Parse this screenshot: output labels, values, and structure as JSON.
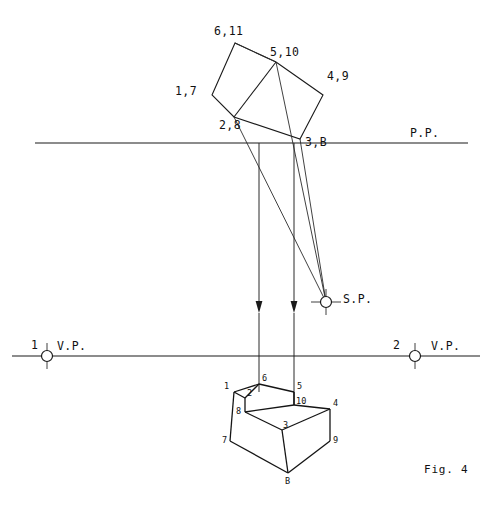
{
  "figure": {
    "caption": "Fig. 4",
    "width": 493,
    "height": 512,
    "background_color": "#ffffff",
    "line_color": "#1a1a1a"
  },
  "reference_lines": {
    "picture_plane": {
      "label": "P.P.",
      "label_x": 410,
      "label_y": 137,
      "y": 143,
      "x1": 35,
      "x2": 468
    },
    "horizon_line": {
      "y": 356,
      "x1": 12,
      "x2": 480
    }
  },
  "station_point": {
    "label": "S.P.",
    "label_x": 343,
    "label_y": 303,
    "x": 326,
    "y": 302,
    "radius": 5.5
  },
  "vanishing_points": [
    {
      "name": "left-vanishing-point",
      "number": "1",
      "label": "V.P.",
      "number_x": 31,
      "number_y": 349,
      "label_x": 57,
      "label_y": 350,
      "x": 47,
      "y": 356,
      "radius": 5.5
    },
    {
      "name": "right-vanishing-point",
      "number": "2",
      "label": "V.P.",
      "number_x": 393,
      "number_y": 349,
      "label_x": 431,
      "label_y": 350,
      "x": 415,
      "y": 356,
      "radius": 5.5
    }
  ],
  "plan_view": {
    "description": "Top plan of the stepped block rotated above the picture plane",
    "vertices": {
      "v1_7": {
        "x": 212,
        "y": 95
      },
      "v6_11": {
        "x": 235,
        "y": 43
      },
      "v5_10": {
        "x": 276,
        "y": 62
      },
      "v4_9": {
        "x": 323,
        "y": 95
      },
      "v3_B": {
        "x": 300,
        "y": 139
      },
      "v2_8": {
        "x": 234,
        "y": 117
      }
    },
    "labels": [
      {
        "name": "plan-label-6-11",
        "text": "6,11",
        "x": 214,
        "y": 35
      },
      {
        "name": "plan-label-5-10",
        "text": "5,10",
        "x": 270,
        "y": 56
      },
      {
        "name": "plan-label-4-9",
        "text": "4,9",
        "x": 327,
        "y": 80
      },
      {
        "name": "plan-label-1-7",
        "text": "1,7",
        "x": 175,
        "y": 95
      },
      {
        "name": "plan-label-2-8",
        "text": "2,8",
        "x": 219,
        "y": 129
      },
      {
        "name": "plan-label-3-B",
        "text": "3,B",
        "x": 305,
        "y": 146
      }
    ]
  },
  "projectors": [
    {
      "name": "projector-left",
      "x": 259,
      "y_top": 143,
      "y_arrow": 313,
      "y_bottom": 392
    },
    {
      "name": "projector-right",
      "x": 294,
      "y_top": 143,
      "y_arrow": 313,
      "y_bottom": 392
    }
  ],
  "sight_lines": [
    {
      "name": "sight-line-from-2-8",
      "x1": 234,
      "y1": 117,
      "x2": 326,
      "y2": 302
    },
    {
      "name": "sight-line-from-5-10",
      "x1": 276,
      "y1": 62,
      "x2": 326,
      "y2": 302
    },
    {
      "name": "sight-line-from-3-B",
      "x1": 300,
      "y1": 139,
      "x2": 326,
      "y2": 302
    }
  ],
  "object_view": {
    "description": "Lower pictorial view of the stepped block",
    "vertices": {
      "p1": {
        "x": 234,
        "y": 392
      },
      "p6": {
        "x": 259,
        "y": 384
      },
      "p5": {
        "x": 294,
        "y": 392
      },
      "p2": {
        "x": 245,
        "y": 398
      },
      "p10": {
        "x": 294,
        "y": 405
      },
      "p8": {
        "x": 245,
        "y": 412
      },
      "p4": {
        "x": 330,
        "y": 409
      },
      "p3": {
        "x": 282,
        "y": 430
      },
      "p7": {
        "x": 230,
        "y": 441
      },
      "p9": {
        "x": 330,
        "y": 441
      },
      "pB": {
        "x": 288,
        "y": 473
      }
    },
    "labels": [
      {
        "name": "object-label-1",
        "text": "1",
        "x": 224,
        "y": 389
      },
      {
        "name": "object-label-6",
        "text": "6",
        "x": 262,
        "y": 381
      },
      {
        "name": "object-label-5",
        "text": "5",
        "x": 297,
        "y": 389
      },
      {
        "name": "object-label-2",
        "text": "2",
        "x": 247,
        "y": 396
      },
      {
        "name": "object-label-10",
        "text": "10",
        "x": 296,
        "y": 404
      },
      {
        "name": "object-label-8",
        "text": "8",
        "x": 236,
        "y": 414
      },
      {
        "name": "object-label-4",
        "text": "4",
        "x": 333,
        "y": 406
      },
      {
        "name": "object-label-3",
        "text": "3",
        "x": 283,
        "y": 428
      },
      {
        "name": "object-label-7",
        "text": "7",
        "x": 222,
        "y": 443
      },
      {
        "name": "object-label-9",
        "text": "9",
        "x": 333,
        "y": 443
      },
      {
        "name": "object-label-B",
        "text": "B",
        "x": 285,
        "y": 484
      }
    ]
  },
  "caption_position": {
    "x": 424,
    "y": 473
  }
}
